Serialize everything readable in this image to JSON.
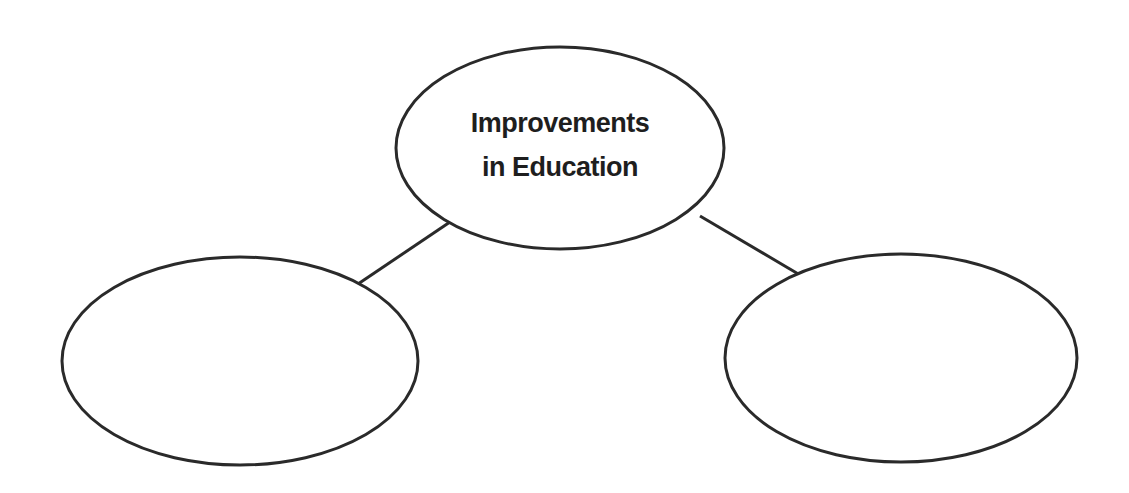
{
  "diagram": {
    "type": "web-organizer",
    "center_node": {
      "lines": [
        "Improvements",
        "in Education"
      ]
    },
    "child_nodes": [
      {
        "label": ""
      },
      {
        "label": ""
      }
    ],
    "colors": {
      "stroke": "#2a2a2a",
      "fill": "#ffffff",
      "text": "#1e1e1e"
    }
  }
}
